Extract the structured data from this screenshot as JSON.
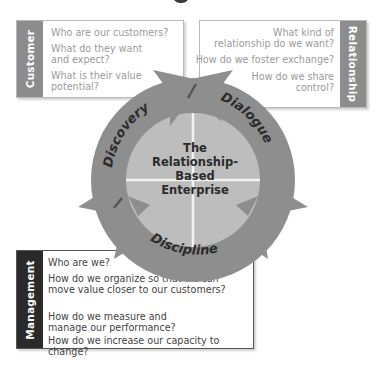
{
  "diagram": {
    "center_title_lines": [
      "The",
      "Relationship-",
      "Based",
      "Enterprise"
    ],
    "cycle_stages": [
      "Discovery",
      "Dialogue",
      "Discipline"
    ],
    "colors": {
      "ring": "#8e8e8e",
      "inner_disc": "#bdbdbd",
      "divider": "#f2f2f2",
      "customer_bar": "#8c8c8c",
      "relationship_bar": "#8c8c8c",
      "management_bar": "#2a2a2a",
      "question_text_light": "#9a9a9a",
      "question_text_dark": "#444444"
    }
  },
  "panels": {
    "customer": {
      "label": "Customer",
      "questions": [
        "Who are our customers?",
        "What do they want and expect?",
        "What is their value potential?"
      ]
    },
    "relationship": {
      "label": "Relationship",
      "questions": [
        "What kind of relationship do we want?",
        "How do we foster exchange?",
        "How do we share control?"
      ]
    },
    "management": {
      "label": "Management",
      "questions": [
        "Who are we?",
        "How do we organize so that we can move value closer to our customers?",
        "How do we measure and manage our performance?",
        "How do we increase our capacity to change?"
      ]
    }
  }
}
